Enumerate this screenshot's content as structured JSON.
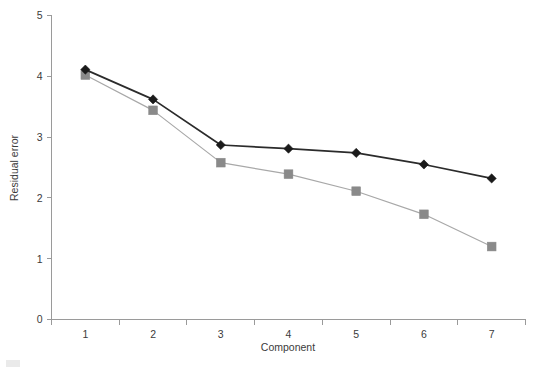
{
  "chart_data": {
    "type": "line",
    "title": "",
    "subtitle": "",
    "xlabel": "Component",
    "ylabel": "Residual error",
    "categories": [
      "1",
      "2",
      "3",
      "4",
      "5",
      "6",
      "7"
    ],
    "x": [
      1,
      2,
      3,
      4,
      5,
      6,
      7
    ],
    "xlim": [
      0.5,
      7.5
    ],
    "ylim": [
      0,
      5
    ],
    "y_ticks": [
      "0",
      "1",
      "2",
      "3",
      "4",
      "5"
    ],
    "y_tick_values": [
      0,
      1,
      2,
      3,
      4,
      5
    ],
    "grid": false,
    "legend": "none",
    "series": [
      {
        "name": "series-diamond",
        "marker": "diamond",
        "marker_color": "#1a1a1a",
        "line_color": "#2b2b2b",
        "values": [
          4.11,
          3.62,
          2.87,
          2.81,
          2.74,
          2.55,
          2.32
        ]
      },
      {
        "name": "series-square",
        "marker": "square",
        "marker_color": "#8a8a8a",
        "line_color": "#a8a8a8",
        "values": [
          4.02,
          3.44,
          2.58,
          2.39,
          2.11,
          1.73,
          1.2
        ]
      }
    ],
    "colors": {
      "axis": "#9a9a9a",
      "text": "#3b3b3b",
      "background": "#ffffff"
    }
  }
}
